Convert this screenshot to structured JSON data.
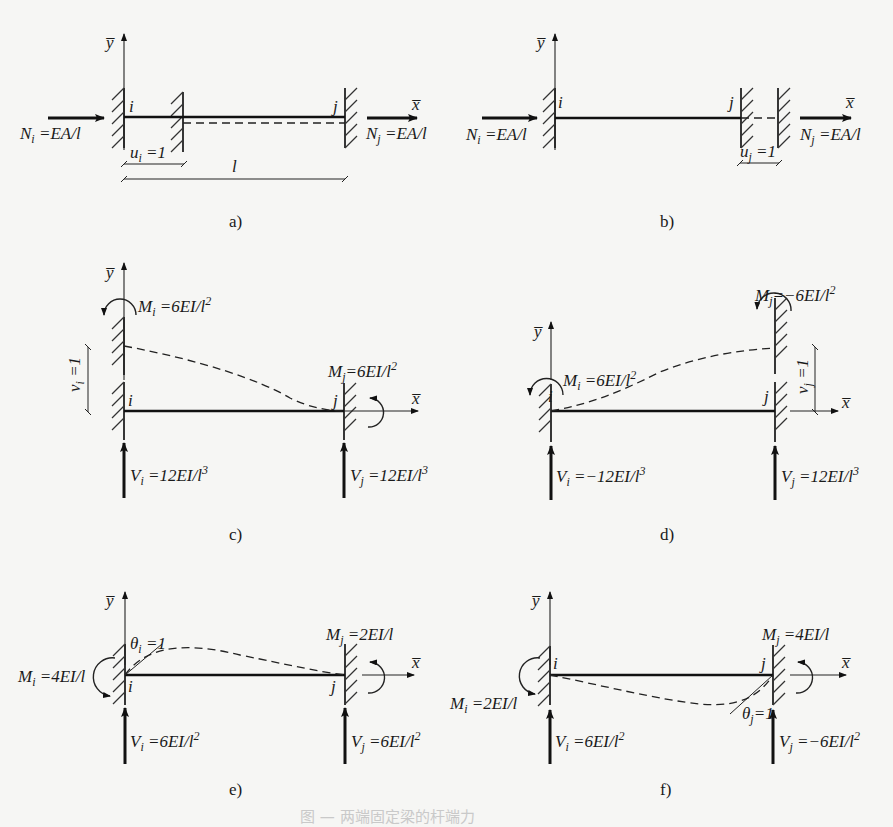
{
  "diagram": {
    "panels": {
      "a": {
        "caption": "a)",
        "axis_y": "y̅",
        "axis_x": "x̅",
        "node_i": "i",
        "node_j": "j",
        "force_i": "N",
        "force_i_sub": "i",
        "force_i_val": " =EA/l",
        "force_j": "N",
        "force_j_sub": "j",
        "force_j_val": " =EA/l",
        "disp": "u",
        "disp_sub": "i",
        "disp_val": " =1",
        "length": "l"
      },
      "b": {
        "caption": "b)",
        "axis_y": "y̅",
        "axis_x": "x̅",
        "node_i": "i",
        "node_j": "j",
        "force_i": "N",
        "force_i_sub": "i",
        "force_i_val": " =EA/l",
        "force_j": "N",
        "force_j_sub": "j",
        "force_j_val": " =EA/l",
        "disp": "u",
        "disp_sub": "j",
        "disp_val": " =1"
      },
      "c": {
        "caption": "c)",
        "axis_y": "y̅",
        "axis_x": "x̅",
        "node_i": "i",
        "node_j": "j",
        "moment_i": "M",
        "moment_i_sub": "i",
        "moment_i_val": " =6EI/l",
        "moment_i_exp": "2",
        "moment_j": "M",
        "moment_j_sub": "j",
        "moment_j_val": "=6EI/l",
        "moment_j_exp": "2",
        "shear_i": "V",
        "shear_i_sub": "i",
        "shear_i_val": " =12EI/l",
        "shear_i_exp": "3",
        "shear_j": "V",
        "shear_j_sub": "j",
        "shear_j_val": " =12EI/l",
        "shear_j_exp": "3",
        "disp": "v",
        "disp_sub": "i",
        "disp_val": " =1"
      },
      "d": {
        "caption": "d)",
        "axis_y": "y̅",
        "axis_x": "x̅",
        "node_i": "i",
        "node_j": "j",
        "moment_i": "M",
        "moment_i_sub": "i",
        "moment_i_val": " =6EI/l",
        "moment_i_exp": "2",
        "moment_j": "M",
        "moment_j_sub": "j",
        "moment_j_val": "=−6EI/l",
        "moment_j_exp": "2",
        "shear_i": "V",
        "shear_i_sub": "i",
        "shear_i_val": " =−12EI/l",
        "shear_i_exp": "3",
        "shear_j": "V",
        "shear_j_sub": "j",
        "shear_j_val": " =12EI/l",
        "shear_j_exp": "3",
        "disp": "v",
        "disp_sub": "j",
        "disp_val": " =1"
      },
      "e": {
        "caption": "e)",
        "axis_y": "y̅",
        "axis_x": "x̅",
        "node_i": "i",
        "node_j": "j",
        "rotation": "θ",
        "rotation_sub": "i",
        "rotation_val": " =1",
        "moment_i": "M",
        "moment_i_sub": "i",
        "moment_i_val": " =4EI/l",
        "moment_j": "M",
        "moment_j_sub": "j",
        "moment_j_val": " =2EI/l",
        "shear_i": "V",
        "shear_i_sub": "i",
        "shear_i_val": " =6EI/l",
        "shear_i_exp": "2",
        "shear_j": "V",
        "shear_j_sub": "j",
        "shear_j_val": " =6EI/l",
        "shear_j_exp": "2"
      },
      "f": {
        "caption": "f)",
        "axis_y": "y̅",
        "axis_x": "x̅",
        "node_i": "i",
        "node_j": "j",
        "rotation": "θ",
        "rotation_sub": "j",
        "rotation_val": "=1",
        "moment_i": "M",
        "moment_i_sub": "i",
        "moment_i_val": " =2EI/l",
        "moment_j": "M",
        "moment_j_sub": "j",
        "moment_j_val": " =4EI/l",
        "shear_i": "V",
        "shear_i_sub": "i",
        "shear_i_val": " =6EI/l",
        "shear_i_exp": "2",
        "shear_j": "V",
        "shear_j_sub": "j",
        "shear_j_val": " =−6EI/l",
        "shear_j_exp": "2"
      }
    },
    "figure_caption": "图 — 两端固定梁的杆端力"
  }
}
